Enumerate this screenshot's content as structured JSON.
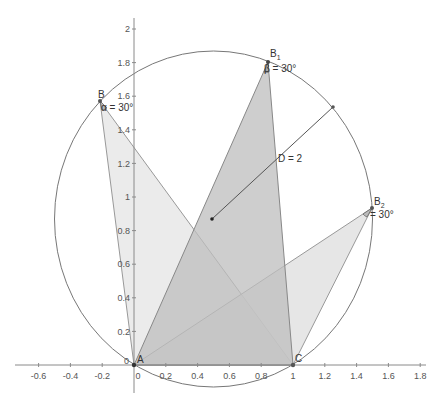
{
  "diagram": {
    "type": "geometry-construction",
    "axes": {
      "x_ticks": [
        "-0.6",
        "-0.4",
        "-0.2",
        "0",
        "0.2",
        "0.4",
        "0.6",
        "0.8",
        "1",
        "1.2",
        "1.4",
        "1.6",
        "1.8"
      ],
      "y_ticks": [
        "0.2",
        "0.4",
        "0.6",
        "0.8",
        "1",
        "1.2",
        "1.4",
        "1.6",
        "1.8",
        "2"
      ],
      "origin_label": "0"
    },
    "circle": {
      "center": [
        0.5,
        0.866
      ],
      "radius": 1
    },
    "points": {
      "A": {
        "label": "A",
        "coords": [
          0,
          0
        ]
      },
      "C": {
        "label": "C",
        "coords": [
          1,
          0
        ]
      },
      "B": {
        "label": "B",
        "coords": [
          -0.21,
          1.57
        ]
      },
      "B1": {
        "label": "B",
        "sub": "1",
        "coords": [
          0.85,
          1.8
        ]
      },
      "B2": {
        "label": "B",
        "sub": "2",
        "coords": [
          1.49,
          0.93
        ]
      },
      "center": {
        "coords": [
          0.5,
          0.866
        ]
      },
      "D_end": {
        "coords": [
          1.25,
          1.53
        ]
      }
    },
    "angles": {
      "alpha": "α = 30°",
      "beta": "β = 30°",
      "gamma": "= 30°"
    },
    "diameter_label": "D = 2",
    "colors": {
      "axis": "#888888",
      "circle": "#777777",
      "triangle_edge": "#888888",
      "fill_light": "#e8e8e8",
      "fill_mid": "#cccccc",
      "fill_dark": "#b4b4b4",
      "point": "#333333"
    }
  }
}
